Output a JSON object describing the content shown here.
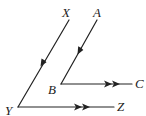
{
  "diagram": {
    "type": "geometry-parallel-angles",
    "stroke_color": "#222222",
    "points": {
      "X": {
        "label": "X",
        "x": 69,
        "y": 20
      },
      "Y": {
        "label": "Y",
        "x": 18,
        "y": 107
      },
      "Z": {
        "label": "Z",
        "x": 114,
        "y": 107
      },
      "A": {
        "label": "A",
        "x": 97,
        "y": 20
      },
      "B": {
        "label": "B",
        "x": 61,
        "y": 84
      },
      "C": {
        "label": "C",
        "x": 132,
        "y": 84
      }
    },
    "segments": [
      {
        "from": "X",
        "to": "Y",
        "marks": "single-arrow"
      },
      {
        "from": "Y",
        "to": "Z",
        "marks": "double-arrow"
      },
      {
        "from": "A",
        "to": "B",
        "marks": "single-arrow"
      },
      {
        "from": "B",
        "to": "C",
        "marks": "double-arrow"
      }
    ],
    "relations": [
      "XY ∥ AB",
      "YZ ∥ BC"
    ]
  }
}
